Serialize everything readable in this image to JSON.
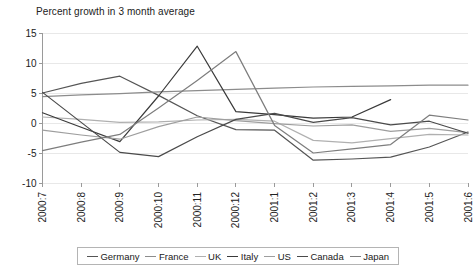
{
  "chart_data": {
    "type": "line",
    "title": "Percent growth in 3 month average",
    "xlabel": "",
    "ylabel": "",
    "ylim": [
      -10,
      15
    ],
    "yticks": [
      15,
      10,
      5,
      0,
      -5,
      -10
    ],
    "ytick_labels": [
      "15",
      "10",
      "5",
      "0",
      "-5",
      "-10"
    ],
    "grid": true,
    "legend_position": "bottom",
    "categories": [
      "2000:7",
      "2000:8",
      "2000:9",
      "2000:10",
      "2000:11",
      "2000:12",
      "2001:1",
      "2001:2",
      "2001:3",
      "2001:4",
      "2001:5",
      "2001:6"
    ],
    "series": [
      {
        "name": "Germany",
        "color": "#555555",
        "values": [
          5.0,
          6.6,
          7.8,
          4.6,
          1.2,
          -1.1,
          -1.2,
          -6.2,
          -6.0,
          -5.7,
          -4.0,
          -1.5
        ]
      },
      {
        "name": "France",
        "color": "#8c8c8c",
        "values": [
          4.4,
          4.7,
          4.9,
          5.2,
          5.4,
          5.6,
          5.8,
          6.0,
          6.1,
          6.2,
          6.3,
          6.3
        ]
      },
      {
        "name": "UK",
        "color": "#b0b0b0",
        "values": [
          1.0,
          0.6,
          0.1,
          0.2,
          0.5,
          0.6,
          0.3,
          -2.9,
          -3.3,
          -2.6,
          -1.9,
          -2.0
        ]
      },
      {
        "name": "Italy",
        "color": "#3a3a3a",
        "values": [
          1.7,
          -0.7,
          -3.1,
          4.5,
          12.8,
          1.9,
          1.4,
          0.8,
          1.0,
          3.9,
          null,
          null
        ]
      },
      {
        "name": "US",
        "color": "#9e9e9e",
        "values": [
          -1.2,
          -2.0,
          -2.7,
          -0.6,
          1.0,
          0.4,
          -0.1,
          -0.5,
          -0.3,
          -1.4,
          -0.9,
          -1.6
        ]
      },
      {
        "name": "Canada",
        "color": "#4a4a4a",
        "values": [
          5.1,
          0.1,
          -4.9,
          -5.6,
          -2.3,
          0.6,
          1.6,
          0.1,
          0.9,
          -0.3,
          0.3,
          -1.7
        ]
      },
      {
        "name": "Japan",
        "color": "#7d7d7d",
        "values": [
          -4.6,
          -3.2,
          -1.9,
          2.5,
          7.1,
          11.9,
          -0.4,
          -5.0,
          -4.3,
          -3.6,
          1.3,
          0.5
        ]
      }
    ]
  },
  "legend": {
    "items": [
      {
        "label": "Germany"
      },
      {
        "label": "France"
      },
      {
        "label": "UK"
      },
      {
        "label": "Italy"
      },
      {
        "label": "US"
      },
      {
        "label": "Canada"
      },
      {
        "label": "Japan"
      }
    ]
  }
}
